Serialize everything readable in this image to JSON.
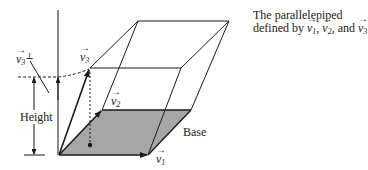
{
  "diagram": {
    "title_line1": "The parallelepiped",
    "title_line2_prefix": "defined by ",
    "title_v1": "v",
    "title_v1_sub": "1",
    "title_sep1": ", ",
    "title_v2": "v",
    "title_v2_sub": "2",
    "title_sep2": ", and ",
    "title_v3": "v",
    "title_v3_sub": "3",
    "labels": {
      "v1": {
        "base": "v",
        "sub": "1"
      },
      "v2": {
        "base": "v",
        "sub": "2"
      },
      "v3": {
        "base": "v",
        "sub": "3"
      },
      "v3perp": {
        "base": "v",
        "sub": "3",
        "sup": "⊥"
      },
      "height": "Height",
      "base": "Base"
    },
    "arrow_glyph": "→",
    "colors": {
      "line": "#1a1a1a",
      "base_fill": "#a6a6a6"
    }
  }
}
